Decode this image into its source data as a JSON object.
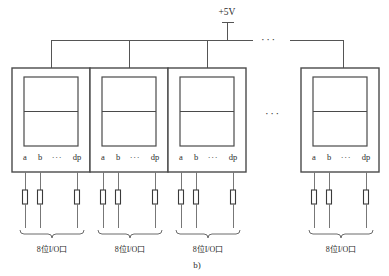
{
  "figure": {
    "caption": "b)",
    "supply_label": "+5V",
    "ellipsis_glyph": "•••",
    "accent_color": "#4a4a4a",
    "wire_color": "#555555",
    "background_color": "#ffffff"
  },
  "pins": {
    "labels": [
      "a",
      "b",
      "dp"
    ],
    "ellipsis": "···"
  },
  "modules": [
    {
      "id": "module-1",
      "io_label": "8位I/O口",
      "pin_a": "a",
      "pin_b": "b",
      "pin_ellipsis": "···",
      "pin_dp": "dp"
    },
    {
      "id": "module-2",
      "io_label": "8位I/O口",
      "pin_a": "a",
      "pin_b": "b",
      "pin_ellipsis": "···",
      "pin_dp": "dp"
    },
    {
      "id": "module-3",
      "io_label": "8位I/O口",
      "pin_a": "a",
      "pin_b": "b",
      "pin_ellipsis": "···",
      "pin_dp": "dp"
    },
    {
      "id": "module-4",
      "io_label": "8位I/O口",
      "pin_a": "a",
      "pin_b": "b",
      "pin_ellipsis": "···",
      "pin_dp": "dp"
    }
  ],
  "bus_ellipsis": "···",
  "module_gap_ellipsis": "···"
}
